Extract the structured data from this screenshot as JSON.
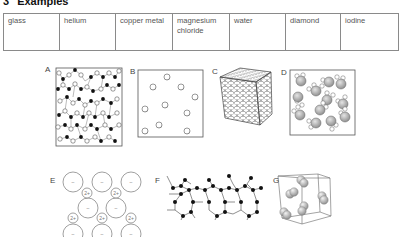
{
  "section": {
    "number": "3",
    "title": "Examples"
  },
  "examples_table": {
    "cells": [
      "glass",
      "helium",
      "copper metal",
      "magnesium chloride",
      "water",
      "diamond",
      "iodine"
    ]
  },
  "diagrams": [
    {
      "label": "A",
      "depicts": "amorphous network of white and black atoms (glass)"
    },
    {
      "label": "B",
      "depicts": "widely spaced single atoms in a box (gas)"
    },
    {
      "label": "C",
      "depicts": "close-packed metal atoms forming a cube"
    },
    {
      "label": "D",
      "depicts": "molecules of one large and two small atoms in a box"
    },
    {
      "label": "E",
      "depicts": "ionic lattice of large negative ions and small 2+ ions"
    },
    {
      "label": "F",
      "depicts": "covalent network of black atoms"
    },
    {
      "label": "G",
      "depicts": "diatomic molecules in a cubic unit cell"
    }
  ],
  "ion_labels": {
    "negative": "–",
    "positive": "2+"
  },
  "colors": {
    "line": "#555555",
    "black_atom": "#111111",
    "grey_atom": "#a8a8a8"
  }
}
